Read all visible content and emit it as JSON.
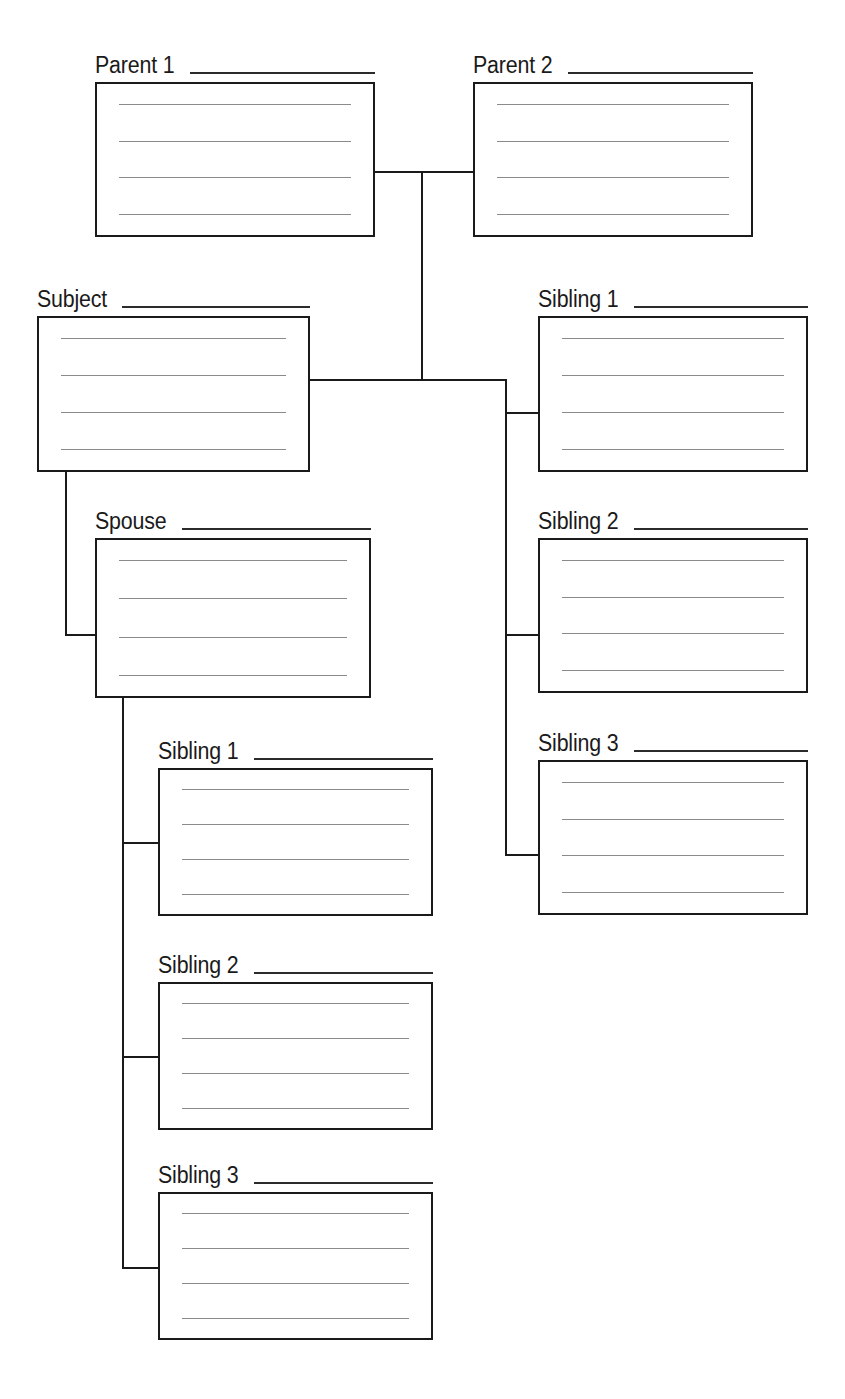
{
  "document": {
    "title": "Family Tree Worksheet",
    "type": "genealogy-chart",
    "background_color": "#ffffff",
    "line_color": "#1a1a1a",
    "rule_color": "#8a8a8a",
    "writing_lines_per_card": 4
  },
  "nodes": {
    "parent1": {
      "label": "Parent 1"
    },
    "parent2": {
      "label": "Parent 2"
    },
    "subject": {
      "label": "Subject"
    },
    "spouse": {
      "label": "Spouse"
    },
    "sibling_right_1": {
      "label": "Sibling 1"
    },
    "sibling_right_2": {
      "label": "Sibling 2"
    },
    "sibling_right_3": {
      "label": "Sibling 3"
    },
    "child_1": {
      "label": "Sibling 1"
    },
    "child_2": {
      "label": "Sibling 2"
    },
    "child_3": {
      "label": "Sibling 3"
    }
  }
}
